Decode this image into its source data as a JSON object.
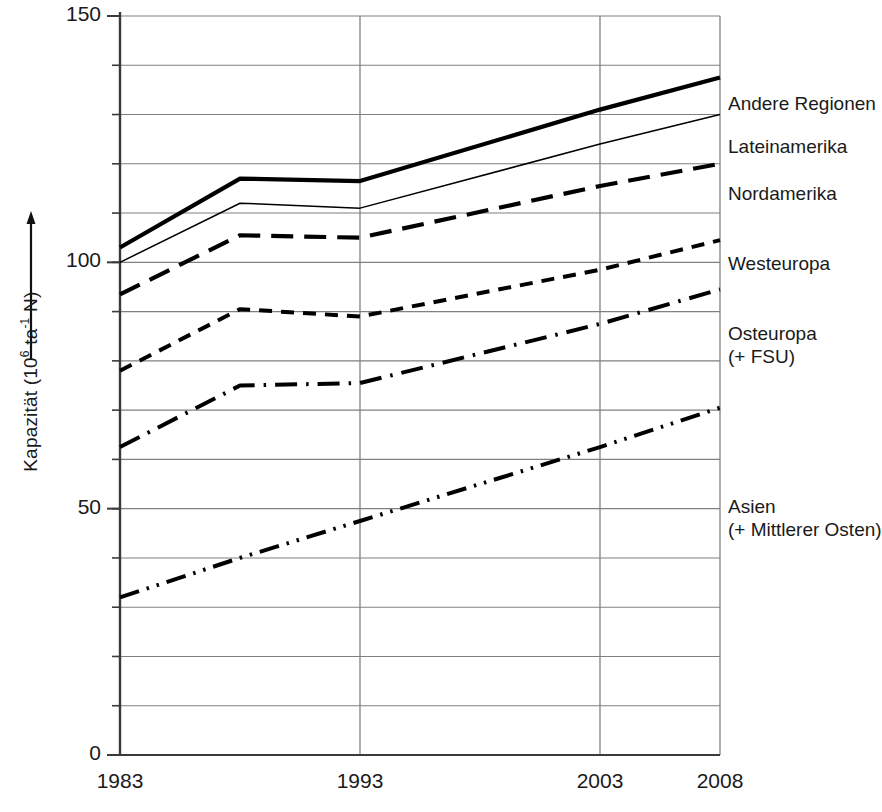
{
  "chart_data": {
    "type": "line",
    "title": "",
    "xlabel": "",
    "ylabel": "Kapazität (10⁶ ta⁻¹ N)",
    "ylabel_parts": {
      "prefix": "Kapazität (10",
      "exp1": "6",
      "mid": " ta",
      "exp2": "-1",
      "suffix": " N)"
    },
    "x_ticks": [
      "1983",
      "1993",
      "2003",
      "2008"
    ],
    "x_tick_values": [
      1983,
      1993,
      2003,
      2008
    ],
    "y_ticks": [
      "0",
      "50",
      "100",
      "150"
    ],
    "y_tick_values": [
      0,
      50,
      100,
      150
    ],
    "ylim": [
      0,
      150
    ],
    "xlim": [
      1983,
      2008
    ],
    "grid": "horizontal-every-10-and-vertical-at-ticks",
    "legend_position": "right-of-plot-at-line-ends",
    "x": [
      1983,
      1988,
      1993,
      2003,
      2008
    ],
    "series": [
      {
        "name": "Andere Regionen",
        "label": "Andere Regionen",
        "style": "solid-thick",
        "values": [
          103,
          117,
          116.5,
          131,
          137.5
        ]
      },
      {
        "name": "Lateinamerika",
        "label": "Lateinamerika",
        "style": "solid-thin",
        "values": [
          100,
          112,
          111,
          124,
          130
        ]
      },
      {
        "name": "Nordamerika",
        "label": "Nordamerika",
        "style": "long-dash",
        "values": [
          93.5,
          105.5,
          105,
          115.5,
          120
        ]
      },
      {
        "name": "Westeuropa",
        "label": "Westeuropa",
        "style": "short-dash",
        "values": [
          78,
          90.5,
          89,
          98.5,
          104.5
        ]
      },
      {
        "name": "Osteuropa (+ FSU)",
        "label_line1": "Osteuropa",
        "label_line2": "(+ FSU)",
        "style": "dash-dot",
        "values": [
          62.5,
          75,
          75.5,
          87.5,
          94.5
        ]
      },
      {
        "name": "Asien (+ Mittlerer Osten)",
        "label_line1": "Asien",
        "label_line2": "(+ Mittlerer Osten)",
        "style": "dash-dot-dot",
        "values": [
          32,
          40,
          47.5,
          62.5,
          70.5
        ]
      }
    ],
    "colors": {
      "line": "#000000",
      "grid": "#808080",
      "axis": "#3a3a3a",
      "text": "#1a1a1a",
      "background": "#ffffff"
    }
  }
}
